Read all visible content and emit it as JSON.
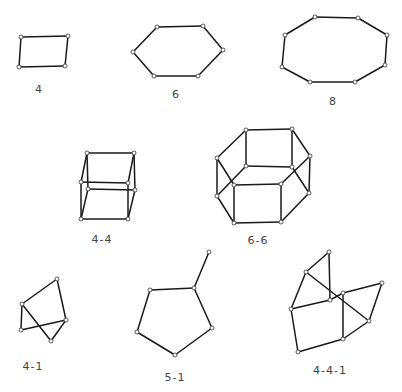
{
  "colors": {
    "edge": "#1a1a1a",
    "node_fill": "#ffffff",
    "label": "#444444",
    "background": "#ffffff"
  },
  "figures": [
    {
      "label": "4",
      "label_pos": [
        39,
        83
      ],
      "nodes": [
        [
          21,
          37
        ],
        [
          68,
          36
        ],
        [
          65,
          66
        ],
        [
          19,
          67
        ]
      ],
      "edges": [
        [
          0,
          1
        ],
        [
          1,
          2
        ],
        [
          2,
          3
        ],
        [
          3,
          0
        ]
      ]
    },
    {
      "label": "6",
      "label_pos": [
        176,
        88
      ],
      "nodes": [
        [
          157,
          27
        ],
        [
          203,
          26
        ],
        [
          223,
          50
        ],
        [
          198,
          76
        ],
        [
          154,
          76
        ],
        [
          133,
          52
        ]
      ],
      "edges": [
        [
          0,
          1
        ],
        [
          1,
          2
        ],
        [
          2,
          3
        ],
        [
          3,
          4
        ],
        [
          4,
          5
        ],
        [
          5,
          0
        ]
      ]
    },
    {
      "label": "8",
      "label_pos": [
        333,
        95
      ],
      "nodes": [
        [
          315,
          17
        ],
        [
          358,
          18
        ],
        [
          387,
          35
        ],
        [
          385,
          65
        ],
        [
          355,
          82
        ],
        [
          310,
          82
        ],
        [
          282,
          67
        ],
        [
          285,
          35
        ]
      ],
      "edges": [
        [
          0,
          1
        ],
        [
          1,
          2
        ],
        [
          2,
          3
        ],
        [
          3,
          4
        ],
        [
          4,
          5
        ],
        [
          5,
          6
        ],
        [
          6,
          7
        ],
        [
          7,
          0
        ]
      ]
    },
    {
      "label": "4-4",
      "label_pos": [
        102,
        233
      ],
      "nodes": [
        [
          87,
          153
        ],
        [
          134,
          153
        ],
        [
          128,
          183
        ],
        [
          81,
          182
        ],
        [
          88,
          189
        ],
        [
          135,
          190
        ],
        [
          128,
          219
        ],
        [
          81,
          219
        ]
      ],
      "edges": [
        [
          0,
          1
        ],
        [
          1,
          2
        ],
        [
          2,
          3
        ],
        [
          3,
          0
        ],
        [
          4,
          5
        ],
        [
          5,
          6
        ],
        [
          6,
          7
        ],
        [
          7,
          4
        ],
        [
          0,
          4
        ],
        [
          1,
          5
        ],
        [
          2,
          6
        ],
        [
          3,
          7
        ]
      ]
    },
    {
      "label": "6-6",
      "label_pos": [
        258,
        234
      ],
      "nodes": [
        [
          246,
          130
        ],
        [
          292,
          129
        ],
        [
          310,
          156
        ],
        [
          281,
          184
        ],
        [
          234,
          185
        ],
        [
          217,
          158
        ],
        [
          246,
          166
        ],
        [
          292,
          167
        ],
        [
          309,
          193
        ],
        [
          281,
          222
        ],
        [
          234,
          223
        ],
        [
          217,
          196
        ]
      ],
      "edges": [
        [
          0,
          1
        ],
        [
          1,
          2
        ],
        [
          2,
          3
        ],
        [
          3,
          4
        ],
        [
          4,
          5
        ],
        [
          5,
          0
        ],
        [
          6,
          7
        ],
        [
          7,
          8
        ],
        [
          8,
          9
        ],
        [
          9,
          10
        ],
        [
          10,
          11
        ],
        [
          11,
          6
        ],
        [
          0,
          6
        ],
        [
          1,
          7
        ],
        [
          2,
          8
        ],
        [
          3,
          9
        ],
        [
          4,
          10
        ],
        [
          5,
          11
        ]
      ]
    },
    {
      "label": "4-1",
      "label_pos": [
        33,
        360
      ],
      "nodes": [
        [
          57,
          279
        ],
        [
          22,
          304
        ],
        [
          21,
          330
        ],
        [
          66,
          320
        ],
        [
          51,
          341
        ]
      ],
      "edges": [
        [
          0,
          1
        ],
        [
          0,
          3
        ],
        [
          1,
          2
        ],
        [
          2,
          3
        ],
        [
          1,
          4
        ],
        [
          3,
          4
        ]
      ]
    },
    {
      "label": "5-1",
      "label_pos": [
        175,
        371
      ],
      "nodes": [
        [
          209,
          252
        ],
        [
          194,
          288
        ],
        [
          150,
          290
        ],
        [
          137,
          332
        ],
        [
          175,
          355
        ],
        [
          212,
          328
        ]
      ],
      "edges": [
        [
          0,
          1
        ],
        [
          1,
          2
        ],
        [
          2,
          3
        ],
        [
          3,
          4
        ],
        [
          4,
          5
        ],
        [
          5,
          1
        ]
      ]
    },
    {
      "label": "4-4-1",
      "label_pos": [
        330,
        364
      ],
      "nodes": [
        [
          329,
          252
        ],
        [
          306,
          272
        ],
        [
          291,
          309
        ],
        [
          330,
          300
        ],
        [
          343,
          293
        ],
        [
          382,
          283
        ],
        [
          369,
          321
        ],
        [
          343,
          339
        ],
        [
          298,
          352
        ]
      ],
      "edges": [
        [
          0,
          1
        ],
        [
          0,
          3
        ],
        [
          1,
          2
        ],
        [
          1,
          6
        ],
        [
          2,
          3
        ],
        [
          2,
          8
        ],
        [
          8,
          7
        ],
        [
          7,
          4
        ],
        [
          4,
          5
        ],
        [
          5,
          6
        ],
        [
          6,
          7
        ],
        [
          3,
          4
        ]
      ]
    }
  ]
}
